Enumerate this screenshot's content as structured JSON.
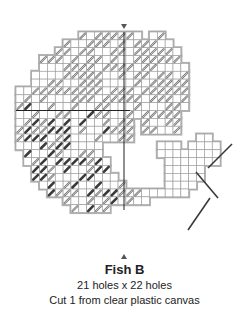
{
  "title": "Fish B",
  "dimensions": "21 holes x 22 holes",
  "instruction": "Cut 1 from clear plastic canvas",
  "colors": {
    "grid": "#9a9a9a",
    "outline": "#b0b0b0",
    "stitch_light": "#c8c8c8",
    "stitch_light_stroke": "#7a7a7a",
    "stitch_dark": "#3a3a3a",
    "center_line": "#222222",
    "marker": "#555555"
  },
  "grid": {
    "cell": 7.85,
    "origin_x": 16,
    "origin_y": 32,
    "rows": [
      [
        [
          9,
          16
        ],
        [
          18,
          19
        ]
      ],
      [
        [
          7,
          20
        ]
      ],
      [
        [
          6,
          21
        ]
      ],
      [
        [
          4,
          21
        ]
      ],
      [
        [
          4,
          22
        ]
      ],
      [
        [
          3,
          22
        ]
      ],
      [
        [
          3,
          22
        ]
      ],
      [
        [
          1,
          22
        ]
      ],
      [
        [
          1,
          22
        ]
      ],
      [
        [
          1,
          22
        ]
      ],
      [
        [
          1,
          21
        ]
      ],
      [
        [
          1,
          15
        ],
        [
          17,
          21
        ]
      ],
      [
        [
          1,
          11
        ],
        [
          12,
          15
        ],
        [
          17,
          21
        ]
      ],
      [
        [
          1,
          11
        ],
        [
          12,
          15
        ],
        [
          24,
          25
        ]
      ],
      [
        [
          1,
          11
        ],
        [
          19,
          21
        ],
        [
          23,
          26
        ]
      ],
      [
        [
          2,
          11
        ],
        [
          19,
          23
        ],
        [
          24,
          26
        ]
      ],
      [
        [
          2,
          12
        ],
        [
          20,
          26
        ]
      ],
      [
        [
          3,
          12
        ],
        [
          20,
          24
        ]
      ],
      [
        [
          3,
          13
        ],
        [
          20,
          24
        ]
      ],
      [
        [
          4,
          14
        ],
        [
          20,
          23
        ]
      ],
      [
        [
          5,
          22
        ]
      ],
      [
        [
          7,
          17
        ]
      ],
      [
        [
          8,
          12
        ]
      ]
    ]
  },
  "markers": {
    "top_x": 124,
    "top_y": 24,
    "bottom_x": 124,
    "bottom_y": 254
  }
}
